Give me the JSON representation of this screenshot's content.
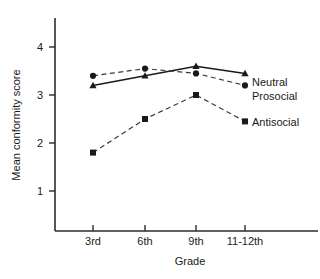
{
  "chart_data": {
    "type": "line",
    "title": "",
    "xlabel": "Grade",
    "ylabel": "Mean conformity score",
    "categories": [
      "3rd",
      "6th",
      "9th",
      "11-12th"
    ],
    "ytick_labels": [
      "1",
      "2",
      "3",
      "4"
    ],
    "ytick_values": [
      1,
      2,
      3,
      4
    ],
    "ylim": [
      0.4,
      4.6
    ],
    "grid": false,
    "legend_position": "right-inline",
    "series": [
      {
        "name": "Neutral",
        "values": [
          3.2,
          3.4,
          3.6,
          3.45
        ],
        "marker": "triangle",
        "line_style": "solid"
      },
      {
        "name": "Prosocial",
        "values": [
          3.4,
          3.55,
          3.45,
          3.2
        ],
        "marker": "circle",
        "line_style": "dashed"
      },
      {
        "name": "Antisocial",
        "values": [
          1.8,
          2.5,
          3.0,
          2.45
        ],
        "marker": "square",
        "line_style": "dashed"
      }
    ]
  },
  "axes": {
    "y_title": "Mean conformity score",
    "x_title": "Grade",
    "y_ticks": [
      {
        "label": "4"
      },
      {
        "label": "3"
      },
      {
        "label": "2"
      },
      {
        "label": "1"
      }
    ],
    "x_ticks": [
      {
        "label": "3rd"
      },
      {
        "label": "6th"
      },
      {
        "label": "9th"
      },
      {
        "label": "11-12th"
      }
    ]
  },
  "legend": {
    "entries": [
      {
        "label": "Neutral"
      },
      {
        "label": "Prosocial"
      },
      {
        "label": "Antisocial"
      }
    ]
  },
  "colors": {
    "axis": "#2b2b2b",
    "ink": "#1a1a1a",
    "dashed_ink": "#3a3a3a",
    "background": "#ffffff"
  }
}
